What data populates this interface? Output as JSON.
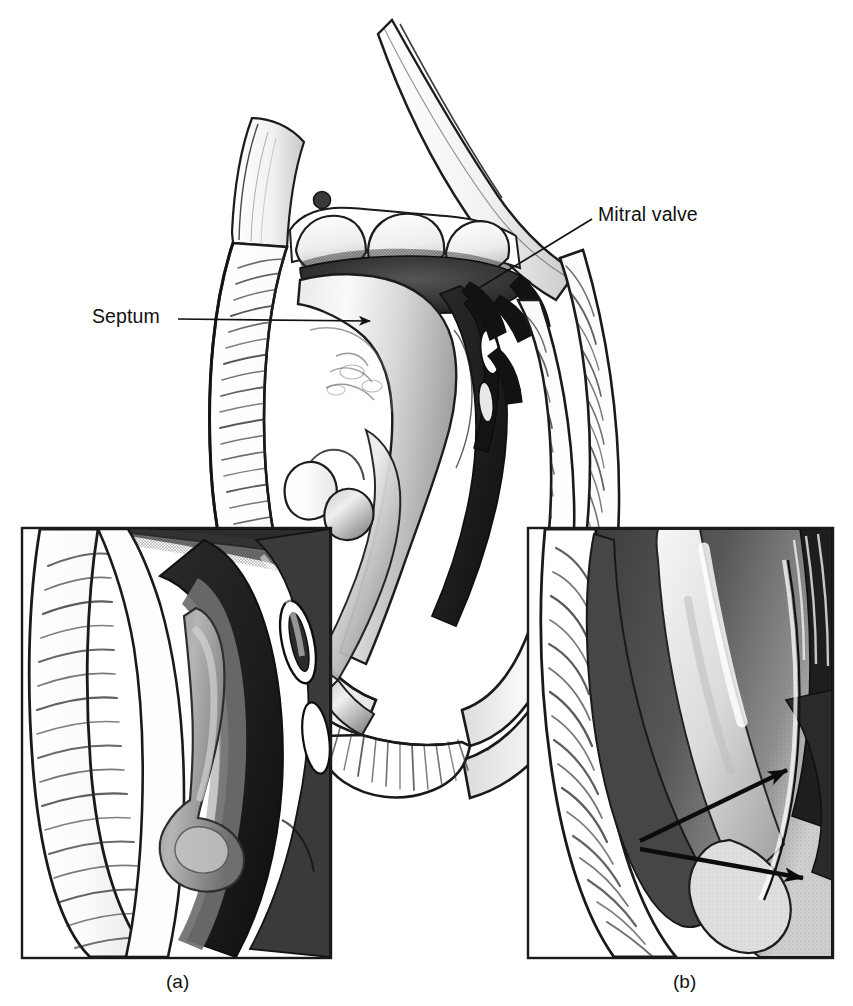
{
  "figure": {
    "type": "medical-illustration",
    "style": "grayscale pen-and-ink stipple and hatch drawing",
    "background_color": "#ffffff",
    "ink_color": "#1a1a1a"
  },
  "labels": {
    "septum": "Septum",
    "mitral_valve": "Mitral valve"
  },
  "captions": {
    "panel_a": "(a)",
    "panel_b": "(b)"
  },
  "leader_lines": [
    {
      "name": "septum-leader",
      "label": "Septum",
      "from": [
        178,
        318
      ],
      "to": [
        377,
        322
      ],
      "arrowhead": "right"
    },
    {
      "name": "mitral-valve-leader",
      "label": "Mitral valve",
      "from": [
        592,
        218
      ],
      "to": [
        457,
        300
      ],
      "arrowhead": "down-left"
    }
  ],
  "panels": [
    {
      "id": "a",
      "caption": "(a)",
      "x": 21,
      "y": 527,
      "width": 311,
      "height": 432,
      "content": "Magnified inset of the left ventricular outflow tract wall showing an elongated dark intracavity structure"
    },
    {
      "id": "b",
      "caption": "(b)",
      "x": 527,
      "y": 527,
      "width": 307,
      "height": 432,
      "content": "Magnified inset of the left ventricular wall with two pointer arrows indicating features along the endocardial surface",
      "arrows": [
        {
          "name": "panel-b-arrow-upper",
          "from": [
            640,
            840
          ],
          "to": [
            800,
            763
          ]
        },
        {
          "name": "panel-b-arrow-lower",
          "from": [
            640,
            848
          ],
          "to": [
            820,
            880
          ]
        }
      ]
    }
  ]
}
